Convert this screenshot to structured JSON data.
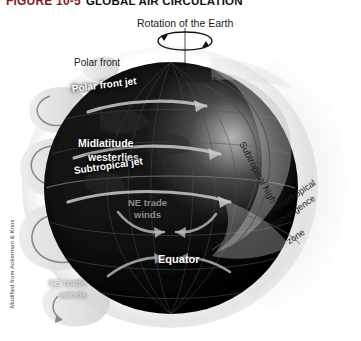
{
  "figure": {
    "number": "FIGURE 10-5",
    "title": "GLOBAL AIR CIRCULATION",
    "credit": "Modified from Ackerman & Knox"
  },
  "colors": {
    "figure_number": "#8c1a2b",
    "title": "#111111",
    "globe_dark": "#0a0a0a",
    "band_gray": "#b9b9b9",
    "label_white": "#ffffff",
    "label_gray": "#cfcfcf",
    "label_dark": "#1d1d1d"
  },
  "rotation": {
    "label": "Rotation of the Earth",
    "icon": "rotation-arrow-icon"
  },
  "labels": {
    "polar_front": "Polar front",
    "polar_easterlies_1": "Polar",
    "polar_easterlies_2": "easterlies",
    "polar_front_jet": "Polar front jet",
    "midlatitude_1": "Midlatitude",
    "midlatitude_2": "westerlies",
    "subtropical_jet": "Subtropical jet",
    "ne_trades_1": "NE trade",
    "ne_trades_2": "winds",
    "equator": "Equator",
    "se_trades_1": "SE trade",
    "se_trades_2": "winds",
    "subtropical_high": "Subtropical high",
    "itcz_1": "Intertropical",
    "itcz_2": "convergence",
    "itcz_3": "zone"
  },
  "diagram": {
    "type": "earth-global-circulation",
    "cells": [
      "polar-cell",
      "ferrel-cell",
      "hadley-cell"
    ],
    "icons": [
      "rotation-arrow-icon",
      "circulation-cell-arrow-icon",
      "jet-stream-arrow-icon",
      "trade-wind-arrow-icon"
    ]
  }
}
